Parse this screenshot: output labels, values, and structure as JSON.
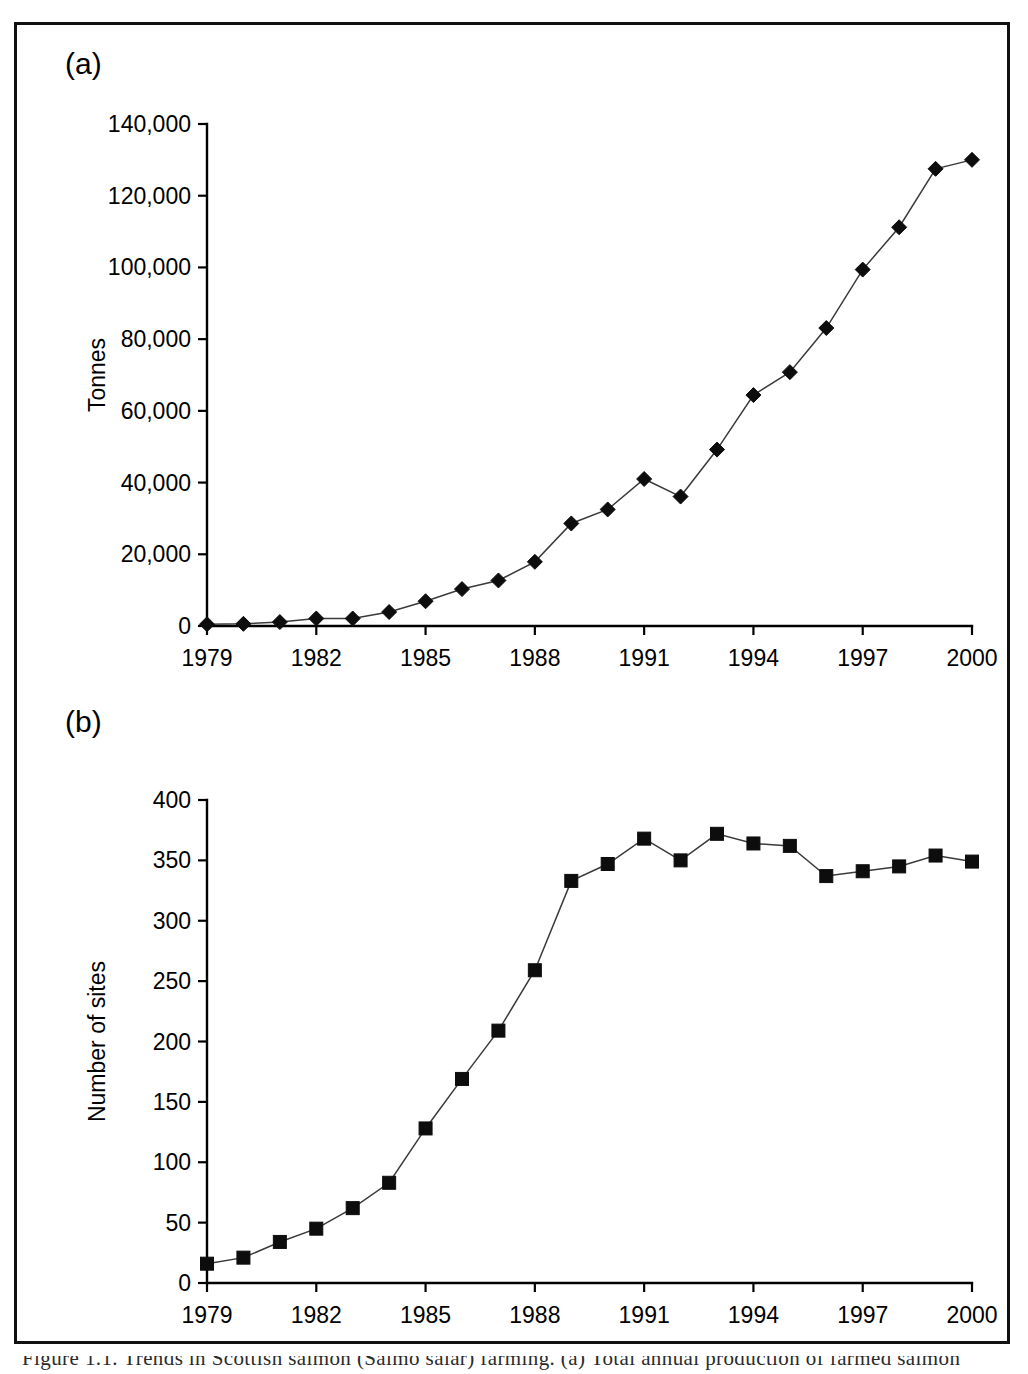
{
  "figure": {
    "panel_a_label": "(a)",
    "panel_b_label": "(b)",
    "caption": "Figure 1.1. Trends in Scottish salmon (Salmo salar) farming. (a) Total annual production of farmed salmon"
  },
  "chart_data": [
    {
      "type": "line",
      "panel": "(a)",
      "title": "",
      "xlabel": "Year",
      "ylabel": "Tonnes",
      "xlim": [
        1979,
        2000
      ],
      "ylim": [
        0,
        140000
      ],
      "xticks": [
        1979,
        1982,
        1985,
        1988,
        1991,
        1994,
        1997,
        2000
      ],
      "xtick_labels": [
        "1979",
        "1982",
        "1985",
        "1988",
        "1991",
        "1994",
        "1997",
        "2000"
      ],
      "yticks": [
        0,
        20000,
        40000,
        60000,
        80000,
        100000,
        120000,
        140000
      ],
      "ytick_labels": [
        "0",
        "20,000",
        "40,000",
        "60,000",
        "80,000",
        "100,000",
        "120,000",
        "140,000"
      ],
      "grid": false,
      "legend": false,
      "marker": "diamond",
      "x": [
        1979,
        1980,
        1981,
        1982,
        1983,
        1984,
        1985,
        1986,
        1987,
        1988,
        1989,
        1990,
        1991,
        1992,
        1993,
        1994,
        1995,
        1996,
        1997,
        1998,
        1999,
        2000
      ],
      "values": [
        500,
        600,
        1100,
        2100,
        2100,
        3900,
        6900,
        10300,
        12700,
        17900,
        28600,
        32500,
        41000,
        36100,
        49200,
        64400,
        70800,
        83100,
        99400,
        111200,
        127500,
        130000
      ]
    },
    {
      "type": "line",
      "panel": "(b)",
      "title": "",
      "xlabel": "Year",
      "ylabel": "Number of sites",
      "xlim": [
        1979,
        2000
      ],
      "ylim": [
        0,
        400
      ],
      "xticks": [
        1979,
        1982,
        1985,
        1988,
        1991,
        1994,
        1997,
        2000
      ],
      "xtick_labels": [
        "1979",
        "1982",
        "1985",
        "1988",
        "1991",
        "1994",
        "1997",
        "2000"
      ],
      "yticks": [
        0,
        50,
        100,
        150,
        200,
        250,
        300,
        350,
        400
      ],
      "ytick_labels": [
        "0",
        "50",
        "100",
        "150",
        "200",
        "250",
        "300",
        "350",
        "400"
      ],
      "grid": false,
      "legend": false,
      "marker": "square",
      "x": [
        1979,
        1980,
        1981,
        1982,
        1983,
        1984,
        1985,
        1986,
        1987,
        1988,
        1989,
        1990,
        1991,
        1992,
        1993,
        1994,
        1995,
        1996,
        1997,
        1998,
        1999,
        2000
      ],
      "values": [
        16,
        21,
        34,
        45,
        62,
        83,
        128,
        169,
        209,
        259,
        333,
        347,
        368,
        350,
        372,
        364,
        362,
        337,
        341,
        345,
        354,
        349
      ]
    }
  ]
}
